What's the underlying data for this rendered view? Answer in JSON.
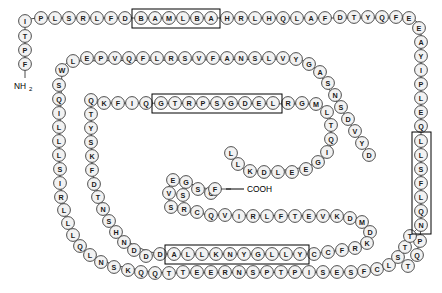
{
  "diagram": {
    "n_terminus_label": "NH",
    "n_terminus_sub": "2",
    "c_terminus_label": "COOH",
    "bead_fill": "#f2f2f2",
    "bead_stroke": "#3a3a3a",
    "motif_box_stroke": "#000000",
    "background": "#ffffff"
  },
  "chain": {
    "segments": [
      {
        "id": "n-term-stub",
        "direction": "down",
        "residues": [
          "I",
          "T",
          "P",
          "F"
        ]
      },
      {
        "id": "row1",
        "direction": "right",
        "residues": [
          "I",
          "P",
          "L",
          "S",
          "R",
          "L",
          "F",
          "D",
          "B",
          "A",
          "M",
          "L",
          "B",
          "A",
          "H",
          "R",
          "L",
          "H",
          "Q",
          "L",
          "A",
          "F",
          "D",
          "T",
          "Y",
          "Q",
          "F",
          "E"
        ]
      },
      {
        "id": "right-column",
        "direction": "down",
        "residues": [
          "E",
          "A",
          "Y",
          "I",
          "P",
          "L",
          "E",
          "Q",
          "L",
          "L",
          "S",
          "F",
          "L",
          "Q",
          "N",
          "P",
          "Q",
          "T"
        ]
      },
      {
        "id": "row2",
        "direction": "right",
        "residues": [
          "W",
          "L",
          "E",
          "P",
          "V",
          "Q",
          "F",
          "L",
          "R",
          "S",
          "V",
          "F",
          "A",
          "N",
          "S",
          "L",
          "V",
          "Y",
          "G",
          "A",
          "S",
          "N",
          "S",
          "D",
          "V",
          "Y",
          "D"
        ]
      },
      {
        "id": "left-column",
        "direction": "down",
        "residues": [
          "W",
          "S",
          "Q",
          "I",
          "L",
          "L",
          "L",
          "S",
          "I",
          "R",
          "L",
          "L",
          "Q",
          "L",
          "N",
          "S",
          "K",
          "Q",
          "Q",
          "T"
        ]
      },
      {
        "id": "row3",
        "direction": "right",
        "residues": [
          "Q",
          "T",
          "Y",
          "S",
          "K",
          "F",
          "D",
          "T",
          "N",
          "S",
          "H",
          "N",
          "D",
          "D"
        ]
      },
      {
        "id": "row3-upper",
        "direction": "right",
        "residues": [
          "Q",
          "K",
          "F",
          "I",
          "Q",
          "G",
          "T",
          "R",
          "P",
          "S",
          "G",
          "D",
          "E",
          "L",
          "R",
          "G",
          "M",
          "L",
          "T",
          "Q"
        ]
      },
      {
        "id": "hairpin-inner",
        "direction": "right",
        "residues": [
          "E",
          "V",
          "S",
          "G",
          "S",
          "R",
          "C",
          "C",
          "G",
          "Q",
          "F",
          "V",
          "I",
          "R",
          "L",
          "F",
          "T",
          "E",
          "V",
          "K",
          "D",
          "M",
          "D",
          "K",
          "R",
          "C",
          "F",
          "Y"
        ]
      },
      {
        "id": "row4",
        "direction": "right",
        "residues": [
          "A",
          "L",
          "L",
          "K",
          "N",
          "Y",
          "G",
          "L",
          "L",
          "Y"
        ]
      },
      {
        "id": "bottom-row",
        "direction": "right",
        "residues": [
          "T",
          "E",
          "E",
          "R",
          "N",
          "S",
          "P",
          "T",
          "P",
          "I",
          "S",
          "E",
          "S",
          "F",
          "C",
          "L",
          "S",
          "T",
          "T"
        ]
      },
      {
        "id": "inner-loop-right",
        "direction": "up",
        "residues": [
          "I",
          "G",
          "E",
          "E",
          "L",
          "D",
          "K",
          "L",
          "L"
        ]
      }
    ],
    "motifs": [
      {
        "id": "motif-1",
        "label": "BAMLBA",
        "residues": [
          "B",
          "A",
          "M",
          "L",
          "B",
          "A"
        ]
      },
      {
        "id": "motif-2",
        "label": "GTRPSGDEL",
        "residues": [
          "G",
          "T",
          "R",
          "P",
          "S",
          "G",
          "D",
          "E",
          "L"
        ]
      },
      {
        "id": "motif-3",
        "label": "LLSFLQN",
        "residues": [
          "L",
          "L",
          "S",
          "F",
          "L",
          "Q",
          "N"
        ]
      },
      {
        "id": "motif-4",
        "label": "ALLKNYGLLY",
        "residues": [
          "A",
          "L",
          "L",
          "K",
          "N",
          "Y",
          "G",
          "L",
          "L",
          "Y"
        ]
      }
    ]
  },
  "beads": [
    {
      "x": 25,
      "y": 21,
      "t": "I"
    },
    {
      "x": 25,
      "y": 36,
      "t": "T"
    },
    {
      "x": 25,
      "y": 50,
      "t": "P"
    },
    {
      "x": 25,
      "y": 64,
      "t": "F"
    },
    {
      "x": 41,
      "y": 18,
      "t": "P"
    },
    {
      "x": 55,
      "y": 18,
      "t": "L"
    },
    {
      "x": 69,
      "y": 18,
      "t": "S"
    },
    {
      "x": 83,
      "y": 18,
      "t": "R"
    },
    {
      "x": 97,
      "y": 18,
      "t": "L"
    },
    {
      "x": 111,
      "y": 18,
      "t": "F"
    },
    {
      "x": 125,
      "y": 18,
      "t": "D"
    },
    {
      "x": 141,
      "y": 18,
      "t": "B"
    },
    {
      "x": 155,
      "y": 18,
      "t": "A"
    },
    {
      "x": 169,
      "y": 18,
      "t": "M"
    },
    {
      "x": 183,
      "y": 18,
      "t": "L"
    },
    {
      "x": 197,
      "y": 18,
      "t": "B"
    },
    {
      "x": 211,
      "y": 18,
      "t": "A"
    },
    {
      "x": 227,
      "y": 18,
      "t": "H"
    },
    {
      "x": 241,
      "y": 18,
      "t": "R"
    },
    {
      "x": 255,
      "y": 18,
      "t": "L"
    },
    {
      "x": 269,
      "y": 18,
      "t": "H"
    },
    {
      "x": 283,
      "y": 18,
      "t": "Q"
    },
    {
      "x": 297,
      "y": 18,
      "t": "L"
    },
    {
      "x": 311,
      "y": 18,
      "t": "A"
    },
    {
      "x": 325,
      "y": 18,
      "t": "F"
    },
    {
      "x": 340,
      "y": 17,
      "t": "D"
    },
    {
      "x": 354,
      "y": 17,
      "t": "T"
    },
    {
      "x": 368,
      "y": 17,
      "t": "Y"
    },
    {
      "x": 382,
      "y": 17,
      "t": "Q"
    },
    {
      "x": 396,
      "y": 17,
      "t": "F"
    },
    {
      "x": 409,
      "y": 18,
      "t": "E"
    },
    {
      "x": 419,
      "y": 28,
      "t": "E"
    },
    {
      "x": 421,
      "y": 42,
      "t": "A"
    },
    {
      "x": 421,
      "y": 56,
      "t": "Y"
    },
    {
      "x": 421,
      "y": 70,
      "t": "I"
    },
    {
      "x": 421,
      "y": 84,
      "t": "P"
    },
    {
      "x": 421,
      "y": 98,
      "t": "L"
    },
    {
      "x": 421,
      "y": 112,
      "t": "E"
    },
    {
      "x": 421,
      "y": 126,
      "t": "Q"
    },
    {
      "x": 421,
      "y": 141,
      "t": "L"
    },
    {
      "x": 421,
      "y": 155,
      "t": "L"
    },
    {
      "x": 421,
      "y": 169,
      "t": "S"
    },
    {
      "x": 421,
      "y": 183,
      "t": "F"
    },
    {
      "x": 421,
      "y": 197,
      "t": "L"
    },
    {
      "x": 421,
      "y": 211,
      "t": "Q"
    },
    {
      "x": 421,
      "y": 225,
      "t": "N"
    },
    {
      "x": 420,
      "y": 241,
      "t": "P"
    },
    {
      "x": 417,
      "y": 255,
      "t": "Q"
    },
    {
      "x": 408,
      "y": 266,
      "t": "T"
    },
    {
      "x": 62,
      "y": 70,
      "t": "W"
    },
    {
      "x": 73,
      "y": 61,
      "t": "L"
    },
    {
      "x": 87,
      "y": 58,
      "t": "E"
    },
    {
      "x": 101,
      "y": 58,
      "t": "P"
    },
    {
      "x": 115,
      "y": 58,
      "t": "V"
    },
    {
      "x": 129,
      "y": 58,
      "t": "Q"
    },
    {
      "x": 143,
      "y": 58,
      "t": "F"
    },
    {
      "x": 157,
      "y": 58,
      "t": "L"
    },
    {
      "x": 171,
      "y": 58,
      "t": "R"
    },
    {
      "x": 185,
      "y": 58,
      "t": "S"
    },
    {
      "x": 199,
      "y": 58,
      "t": "V"
    },
    {
      "x": 213,
      "y": 58,
      "t": "F"
    },
    {
      "x": 227,
      "y": 58,
      "t": "A"
    },
    {
      "x": 241,
      "y": 58,
      "t": "N"
    },
    {
      "x": 255,
      "y": 58,
      "t": "S"
    },
    {
      "x": 269,
      "y": 58,
      "t": "L"
    },
    {
      "x": 283,
      "y": 58,
      "t": "V"
    },
    {
      "x": 296,
      "y": 59,
      "t": "Y"
    },
    {
      "x": 309,
      "y": 64,
      "t": "G"
    },
    {
      "x": 320,
      "y": 72,
      "t": "A"
    },
    {
      "x": 328,
      "y": 83,
      "t": "S"
    },
    {
      "x": 335,
      "y": 95,
      "t": "N"
    },
    {
      "x": 341,
      "y": 107,
      "t": "S"
    },
    {
      "x": 348,
      "y": 119,
      "t": "D"
    },
    {
      "x": 355,
      "y": 131,
      "t": "V"
    },
    {
      "x": 362,
      "y": 143,
      "t": "Y"
    },
    {
      "x": 369,
      "y": 155,
      "t": "D"
    },
    {
      "x": 59,
      "y": 85,
      "t": "S"
    },
    {
      "x": 59,
      "y": 99,
      "t": "Q"
    },
    {
      "x": 59,
      "y": 113,
      "t": "I"
    },
    {
      "x": 59,
      "y": 127,
      "t": "L"
    },
    {
      "x": 59,
      "y": 141,
      "t": "L"
    },
    {
      "x": 59,
      "y": 155,
      "t": "L"
    },
    {
      "x": 60,
      "y": 169,
      "t": "S"
    },
    {
      "x": 60,
      "y": 183,
      "t": "I"
    },
    {
      "x": 61,
      "y": 197,
      "t": "R"
    },
    {
      "x": 64,
      "y": 210,
      "t": "L"
    },
    {
      "x": 68,
      "y": 223,
      "t": "L"
    },
    {
      "x": 73,
      "y": 235,
      "t": "L"
    },
    {
      "x": 80,
      "y": 246,
      "t": "Q"
    },
    {
      "x": 90,
      "y": 255,
      "t": "L"
    },
    {
      "x": 101,
      "y": 262,
      "t": "N"
    },
    {
      "x": 114,
      "y": 267,
      "t": "S"
    },
    {
      "x": 128,
      "y": 270,
      "t": "K"
    },
    {
      "x": 141,
      "y": 272,
      "t": "Q"
    },
    {
      "x": 155,
      "y": 273,
      "t": "Q"
    },
    {
      "x": 169,
      "y": 273,
      "t": "T"
    },
    {
      "x": 91,
      "y": 100,
      "t": "Q"
    },
    {
      "x": 91,
      "y": 114,
      "t": "T"
    },
    {
      "x": 91,
      "y": 128,
      "t": "Y"
    },
    {
      "x": 91,
      "y": 142,
      "t": "S"
    },
    {
      "x": 92,
      "y": 156,
      "t": "K"
    },
    {
      "x": 92,
      "y": 170,
      "t": "F"
    },
    {
      "x": 94,
      "y": 184,
      "t": "D"
    },
    {
      "x": 98,
      "y": 197,
      "t": "T"
    },
    {
      "x": 103,
      "y": 209,
      "t": "N"
    },
    {
      "x": 109,
      "y": 221,
      "t": "S"
    },
    {
      "x": 116,
      "y": 232,
      "t": "H"
    },
    {
      "x": 124,
      "y": 242,
      "t": "N"
    },
    {
      "x": 134,
      "y": 250,
      "t": "D"
    },
    {
      "x": 146,
      "y": 256,
      "t": "D"
    },
    {
      "x": 104,
      "y": 103,
      "t": "K"
    },
    {
      "x": 118,
      "y": 103,
      "t": "F"
    },
    {
      "x": 132,
      "y": 103,
      "t": "I"
    },
    {
      "x": 146,
      "y": 103,
      "t": "Q"
    },
    {
      "x": 161,
      "y": 103,
      "t": "G"
    },
    {
      "x": 175,
      "y": 103,
      "t": "T"
    },
    {
      "x": 189,
      "y": 103,
      "t": "R"
    },
    {
      "x": 203,
      "y": 103,
      "t": "P"
    },
    {
      "x": 217,
      "y": 103,
      "t": "S"
    },
    {
      "x": 231,
      "y": 103,
      "t": "G"
    },
    {
      "x": 245,
      "y": 103,
      "t": "D"
    },
    {
      "x": 259,
      "y": 103,
      "t": "E"
    },
    {
      "x": 273,
      "y": 103,
      "t": "L"
    },
    {
      "x": 288,
      "y": 103,
      "t": "R"
    },
    {
      "x": 302,
      "y": 103,
      "t": "G"
    },
    {
      "x": 316,
      "y": 104,
      "t": "M"
    },
    {
      "x": 327,
      "y": 112,
      "t": "L"
    },
    {
      "x": 331,
      "y": 125,
      "t": "T"
    },
    {
      "x": 331,
      "y": 139,
      "t": "Q"
    },
    {
      "x": 327,
      "y": 152,
      "t": "I"
    },
    {
      "x": 318,
      "y": 162,
      "t": "G"
    },
    {
      "x": 306,
      "y": 169,
      "t": "E"
    },
    {
      "x": 292,
      "y": 172,
      "t": "E"
    },
    {
      "x": 278,
      "y": 172,
      "t": "L"
    },
    {
      "x": 264,
      "y": 172,
      "t": "D"
    },
    {
      "x": 250,
      "y": 171,
      "t": "K"
    },
    {
      "x": 238,
      "y": 164,
      "t": "L"
    },
    {
      "x": 231,
      "y": 153,
      "t": "L"
    },
    {
      "x": 173,
      "y": 180,
      "t": "E"
    },
    {
      "x": 169,
      "y": 193,
      "t": "V"
    },
    {
      "x": 171,
      "y": 207,
      "t": "S"
    },
    {
      "x": 186,
      "y": 182,
      "t": "G"
    },
    {
      "x": 183,
      "y": 195,
      "t": "S"
    },
    {
      "x": 184,
      "y": 209,
      "t": "R"
    },
    {
      "x": 198,
      "y": 189,
      "t": "S"
    },
    {
      "x": 197,
      "y": 212,
      "t": "C"
    },
    {
      "x": 211,
      "y": 193,
      "t": "C"
    },
    {
      "x": 211,
      "y": 215,
      "t": "Q"
    },
    {
      "x": 225,
      "y": 215,
      "t": "V"
    },
    {
      "x": 239,
      "y": 216,
      "t": "I"
    },
    {
      "x": 253,
      "y": 216,
      "t": "R"
    },
    {
      "x": 267,
      "y": 216,
      "t": "L"
    },
    {
      "x": 281,
      "y": 216,
      "t": "F"
    },
    {
      "x": 295,
      "y": 216,
      "t": "T"
    },
    {
      "x": 309,
      "y": 216,
      "t": "E"
    },
    {
      "x": 323,
      "y": 216,
      "t": "V"
    },
    {
      "x": 337,
      "y": 216,
      "t": "K"
    },
    {
      "x": 350,
      "y": 218,
      "t": "D"
    },
    {
      "x": 362,
      "y": 222,
      "t": "M"
    },
    {
      "x": 370,
      "y": 232,
      "t": "D"
    },
    {
      "x": 367,
      "y": 243,
      "t": "K"
    },
    {
      "x": 355,
      "y": 248,
      "t": "R"
    },
    {
      "x": 342,
      "y": 250,
      "t": "F"
    },
    {
      "x": 328,
      "y": 252,
      "t": "C"
    },
    {
      "x": 215,
      "y": 189,
      "t": "F"
    },
    {
      "x": 160,
      "y": 254,
      "t": "D"
    },
    {
      "x": 174,
      "y": 254,
      "t": "A"
    },
    {
      "x": 188,
      "y": 254,
      "t": "L"
    },
    {
      "x": 202,
      "y": 254,
      "t": "L"
    },
    {
      "x": 216,
      "y": 254,
      "t": "K"
    },
    {
      "x": 230,
      "y": 254,
      "t": "N"
    },
    {
      "x": 244,
      "y": 254,
      "t": "Y"
    },
    {
      "x": 258,
      "y": 254,
      "t": "G"
    },
    {
      "x": 272,
      "y": 254,
      "t": "L"
    },
    {
      "x": 286,
      "y": 254,
      "t": "L"
    },
    {
      "x": 300,
      "y": 254,
      "t": "Y"
    },
    {
      "x": 314,
      "y": 254,
      "t": "C"
    },
    {
      "x": 183,
      "y": 272,
      "t": "T"
    },
    {
      "x": 197,
      "y": 272,
      "t": "E"
    },
    {
      "x": 211,
      "y": 272,
      "t": "E"
    },
    {
      "x": 225,
      "y": 272,
      "t": "R"
    },
    {
      "x": 239,
      "y": 272,
      "t": "N"
    },
    {
      "x": 253,
      "y": 272,
      "t": "S"
    },
    {
      "x": 267,
      "y": 272,
      "t": "P"
    },
    {
      "x": 281,
      "y": 272,
      "t": "T"
    },
    {
      "x": 295,
      "y": 272,
      "t": "P"
    },
    {
      "x": 309,
      "y": 272,
      "t": "I"
    },
    {
      "x": 323,
      "y": 272,
      "t": "S"
    },
    {
      "x": 337,
      "y": 272,
      "t": "E"
    },
    {
      "x": 351,
      "y": 272,
      "t": "S"
    },
    {
      "x": 364,
      "y": 271,
      "t": "F"
    },
    {
      "x": 377,
      "y": 269,
      "t": "C"
    },
    {
      "x": 389,
      "y": 265,
      "t": "L"
    },
    {
      "x": 398,
      "y": 257,
      "t": "S"
    },
    {
      "x": 405,
      "y": 247,
      "t": "T"
    },
    {
      "x": 410,
      "y": 236,
      "t": "T"
    }
  ],
  "motif_boxes": [
    {
      "id": "motif-box-1",
      "x": 132,
      "y": 9,
      "w": 88,
      "h": 19
    },
    {
      "id": "motif-box-2",
      "x": 152,
      "y": 94,
      "w": 130,
      "h": 19
    },
    {
      "id": "motif-box-3",
      "x": 412,
      "y": 132,
      "w": 19,
      "h": 102
    },
    {
      "id": "motif-box-4",
      "x": 165,
      "y": 245,
      "w": 144,
      "h": 19
    }
  ],
  "terminus": {
    "n_label_x": 14,
    "n_label_y": 86,
    "c_label_x": 247,
    "c_label_y": 189
  }
}
